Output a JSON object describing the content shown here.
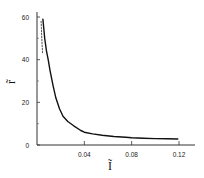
{
  "chart_data": {
    "type": "line",
    "title": "",
    "xlabel": "Ĩ",
    "ylabel": "r̃",
    "xlim": [
      0,
      0.135
    ],
    "ylim": [
      0,
      62
    ],
    "x_ticks": [
      0.04,
      0.08,
      0.12
    ],
    "x_tick_labels": [
      "0.04",
      "0.08",
      "0.12"
    ],
    "y_ticks": [
      0,
      20,
      40,
      60
    ],
    "y_tick_labels": [
      "0",
      "20",
      "40",
      "60"
    ],
    "y_minor_ticks": [
      10,
      30,
      50
    ],
    "grid": false,
    "legend": null,
    "series": [
      {
        "name": "solid",
        "style": "solid",
        "color": "#111111",
        "x": [
          0.005,
          0.0065,
          0.008,
          0.0095,
          0.011,
          0.0135,
          0.016,
          0.019,
          0.022,
          0.026,
          0.031,
          0.037,
          0.04,
          0.047,
          0.055,
          0.065,
          0.075,
          0.08,
          0.09,
          0.1,
          0.11,
          0.119
        ],
        "y": [
          59,
          50,
          44,
          40,
          35,
          28,
          22,
          17,
          13.5,
          11,
          9,
          6.8,
          6.0,
          5.2,
          4.6,
          4.0,
          3.6,
          3.4,
          3.2,
          3.0,
          2.9,
          2.8
        ]
      },
      {
        "name": "dashed",
        "style": "dashed",
        "color": "#555555",
        "x": [
          0.0035,
          0.0037,
          0.004,
          0.0043,
          0.0047
        ],
        "y": [
          58,
          55,
          51,
          47,
          43
        ]
      }
    ]
  },
  "axes": {
    "x_label": "Ĩ",
    "y_label": "r̃"
  }
}
